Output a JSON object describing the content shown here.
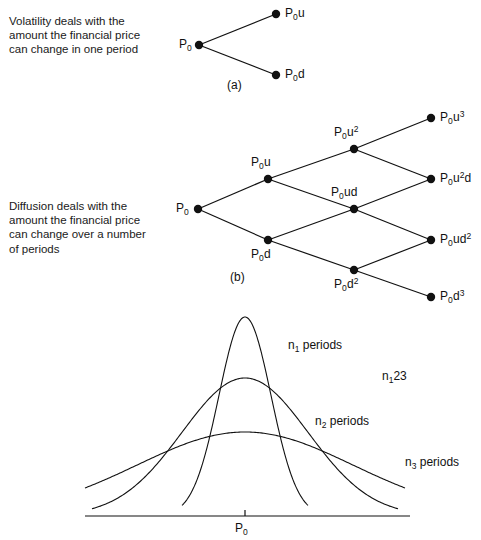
{
  "figure": {
    "width": 481,
    "height": 540,
    "background": "#ffffff",
    "ink_color": "#111111"
  },
  "panel_a": {
    "caption_text": "Volatility deals with the\namount the financial price\ncan change in one period",
    "panel_label": "(a)",
    "root_label_base": "P",
    "root_label_sub": "0",
    "nodes": [
      {
        "id": "root",
        "base": "P",
        "sub": "0",
        "rest": "",
        "sup": "",
        "x": 199,
        "y": 45,
        "label_x": 179,
        "label_y": 37,
        "label_side": "left"
      },
      {
        "id": "up",
        "base": "P",
        "sub": "0",
        "rest": "u",
        "sup": "",
        "x": 276,
        "y": 14,
        "label_x": 285,
        "label_y": 6,
        "label_side": "right"
      },
      {
        "id": "down",
        "base": "P",
        "sub": "0",
        "rest": "d",
        "sup": "",
        "x": 276,
        "y": 75,
        "label_x": 285,
        "label_y": 67,
        "label_side": "right"
      }
    ],
    "edges": [
      {
        "from": "root",
        "to": "up"
      },
      {
        "from": "root",
        "to": "down"
      }
    ]
  },
  "panel_b": {
    "caption_text": "Diffusion deals with the\namount the financial price\ncan change over a number\nof periods",
    "panel_label": "(b)",
    "nodes": [
      {
        "id": "n0",
        "base": "P",
        "sub": "0",
        "rest": "",
        "sup": "",
        "x": 198,
        "y": 209,
        "label_x": 176,
        "label_y": 201,
        "label_side": "left"
      },
      {
        "id": "nu",
        "base": "P",
        "sub": "0",
        "rest": "u",
        "sup": "",
        "x": 268,
        "y": 179,
        "label_x": 251,
        "label_y": 155,
        "label_side": "above"
      },
      {
        "id": "nd",
        "base": "P",
        "sub": "0",
        "rest": "d",
        "sup": "",
        "x": 268,
        "y": 240,
        "label_x": 251,
        "label_y": 247,
        "label_side": "below"
      },
      {
        "id": "nuu",
        "base": "P",
        "sub": "0",
        "rest": "u",
        "sup": "2",
        "x": 354,
        "y": 149,
        "label_x": 334,
        "label_y": 125,
        "label_side": "above"
      },
      {
        "id": "nud",
        "base": "P",
        "sub": "0",
        "rest": "ud",
        "sup": "",
        "x": 354,
        "y": 209,
        "label_x": 331,
        "label_y": 185,
        "label_side": "above"
      },
      {
        "id": "ndd",
        "base": "P",
        "sub": "0",
        "rest": "d",
        "sup": "2",
        "x": 354,
        "y": 270,
        "label_x": 334,
        "label_y": 277,
        "label_side": "below"
      },
      {
        "id": "nuuu",
        "base": "P",
        "sub": "0",
        "rest": "u",
        "sup": "3",
        "x": 431,
        "y": 118,
        "label_x": 440,
        "label_y": 110,
        "label_side": "right"
      },
      {
        "id": "nuud",
        "base": "P",
        "sub": "0",
        "rest": "u",
        "sup": "2",
        "suffix": "d",
        "x": 431,
        "y": 179,
        "label_x": 440,
        "label_y": 171,
        "label_side": "right"
      },
      {
        "id": "nudd",
        "base": "P",
        "sub": "0",
        "rest": "ud",
        "sup": "2",
        "x": 431,
        "y": 240,
        "label_x": 440,
        "label_y": 232,
        "label_side": "right"
      },
      {
        "id": "nddd",
        "base": "P",
        "sub": "0",
        "rest": "d",
        "sup": "3",
        "x": 431,
        "y": 297,
        "label_x": 440,
        "label_y": 289,
        "label_side": "right"
      }
    ],
    "edges": [
      {
        "from": "n0",
        "to": "nu"
      },
      {
        "from": "n0",
        "to": "nd"
      },
      {
        "from": "nu",
        "to": "nuu"
      },
      {
        "from": "nu",
        "to": "nud"
      },
      {
        "from": "nd",
        "to": "nud"
      },
      {
        "from": "nd",
        "to": "ndd"
      },
      {
        "from": "nuu",
        "to": "nuuu"
      },
      {
        "from": "nuu",
        "to": "nuud"
      },
      {
        "from": "nud",
        "to": "nuud"
      },
      {
        "from": "nud",
        "to": "nudd"
      },
      {
        "from": "ndd",
        "to": "nudd"
      },
      {
        "from": "ndd",
        "to": "nddd"
      }
    ]
  },
  "panel_c": {
    "axis_tick_label_base": "P",
    "axis_tick_label_sub": "0",
    "inequality": {
      "n1": "n",
      "s1": "1",
      "op1": "<",
      "n2": "n",
      "s2": "2",
      "op2": "<",
      "n3": "n",
      "s3": "3"
    },
    "curve_labels": [
      {
        "id": "c1",
        "base": "n",
        "sub": "1",
        "rest": " periods",
        "x": 288,
        "y": 338
      },
      {
        "id": "c2",
        "base": "n",
        "sub": "2",
        "rest": " periods",
        "x": 315,
        "y": 414
      },
      {
        "id": "c3",
        "base": "n",
        "sub": "3",
        "rest": " periods",
        "x": 405,
        "y": 455
      }
    ],
    "inequality_label_x": 382,
    "inequality_label_y": 369
  },
  "chart_data": {
    "type": "line",
    "title": "",
    "xlabel": "",
    "ylabel": "",
    "legend_position": "inline-right",
    "grid": false,
    "axis": {
      "baseline_y": 516,
      "x_start": 85,
      "x_end": 410,
      "tick_x": 245,
      "tick_label": "P0"
    },
    "center_x": 245,
    "note": "Three normal probability density curves sharing the mean P0; wider curves correspond to more periods.",
    "series": [
      {
        "name": "n1 periods",
        "label_sub": "1",
        "periods_rank": 1,
        "mean": 245,
        "sigma_px": 26,
        "peak_y": 317,
        "baseline_y": 516,
        "amplitude_px": 199,
        "x_domain": [
          182,
          308
        ]
      },
      {
        "name": "n2 periods",
        "label_sub": "2",
        "periods_rank": 2,
        "mean": 245,
        "sigma_px": 63,
        "peak_y": 378,
        "baseline_y": 516,
        "amplitude_px": 138,
        "x_domain": [
          92,
          398
        ]
      },
      {
        "name": "n3 periods",
        "label_sub": "3",
        "periods_rank": 3,
        "mean": 245,
        "sigma_px": 108,
        "peak_y": 432,
        "baseline_y": 516,
        "amplitude_px": 84,
        "x_domain": [
          85,
          405
        ]
      }
    ]
  }
}
